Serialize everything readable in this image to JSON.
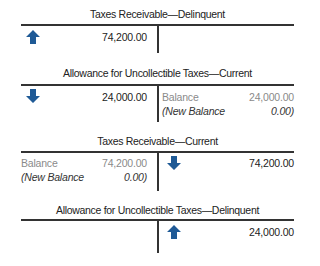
{
  "colors": {
    "arrow": "#1f5a96",
    "line": "#333333",
    "muted_text": "#8a8a8a"
  },
  "accounts": [
    {
      "title": "Taxes Receivable—Delinquent",
      "debit": {
        "arrow": "arrow-up",
        "amount": "74,200.00"
      },
      "credit": {}
    },
    {
      "title": "Allowance for Uncollectible Taxes—Current",
      "debit": {
        "arrow": "arrow-down",
        "amount": "24,000.00"
      },
      "credit": {
        "balance_label": "Balance",
        "balance_amount": "24,000.00",
        "new_balance_label": "(New Balance",
        "new_balance_amount": "0.00)"
      }
    },
    {
      "title": "Taxes Receivable—Current",
      "debit": {
        "balance_label": "Balance",
        "balance_amount": "74,200.00",
        "new_balance_label": "(New Balance",
        "new_balance_amount": "0.00)"
      },
      "credit": {
        "arrow": "arrow-down",
        "amount": "74,200.00"
      }
    },
    {
      "title": "Allowance for Uncollectible Taxes—Delinquent",
      "debit": {},
      "credit": {
        "arrow": "arrow-up",
        "amount": "24,000.00"
      }
    }
  ]
}
